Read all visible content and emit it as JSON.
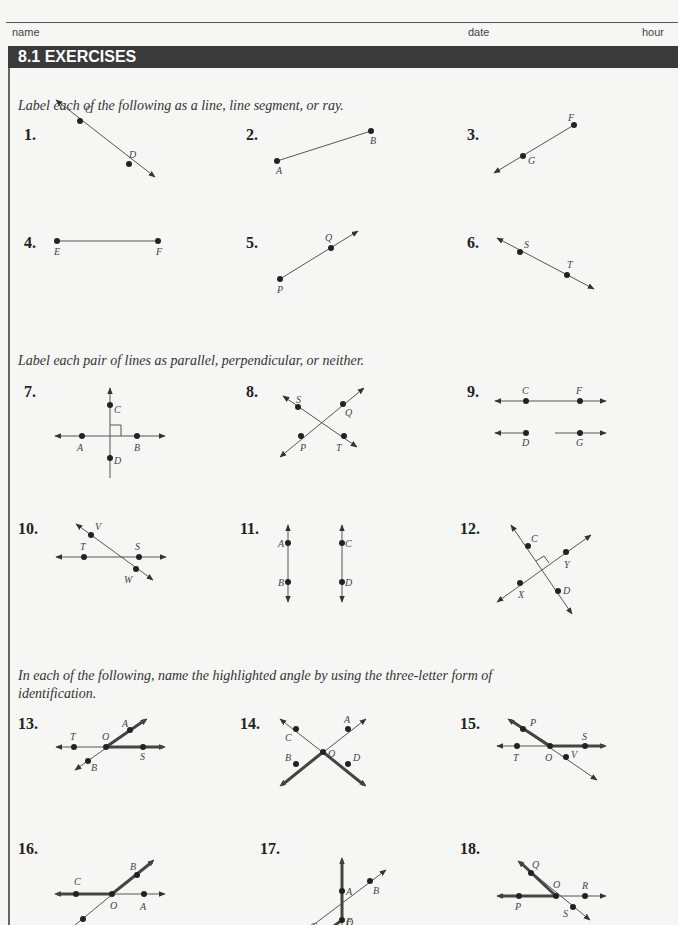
{
  "header": {
    "name_label": "name",
    "date_label": "date",
    "hour_label": "hour"
  },
  "section": {
    "title": "8.1 EXERCISES"
  },
  "instructions": [
    "Label each of the following as a line, line segment, or ray.",
    "Label each pair of lines as parallel, perpendicular, or neither.",
    "In each of the following, name the highlighted angle by using the three-letter form of",
    "identification."
  ],
  "exercises": [
    {
      "n": "1.",
      "points": [
        "C",
        "D"
      ],
      "type": "line"
    },
    {
      "n": "2.",
      "points": [
        "A",
        "B"
      ],
      "type": "segment"
    },
    {
      "n": "3.",
      "points": [
        "F",
        "G"
      ],
      "type": "ray"
    },
    {
      "n": "4.",
      "points": [
        "E",
        "F"
      ],
      "type": "segment"
    },
    {
      "n": "5.",
      "points": [
        "P",
        "Q"
      ],
      "type": "ray"
    },
    {
      "n": "6.",
      "points": [
        "S",
        "T"
      ],
      "type": "line"
    },
    {
      "n": "7.",
      "points": [
        "C",
        "A",
        "B",
        "D"
      ]
    },
    {
      "n": "8.",
      "points": [
        "S",
        "Q",
        "P",
        "T"
      ]
    },
    {
      "n": "9.",
      "points": [
        "C",
        "F",
        "D",
        "G"
      ]
    },
    {
      "n": "10.",
      "points": [
        "V",
        "T",
        "S",
        "W"
      ]
    },
    {
      "n": "11.",
      "points": [
        "A",
        "C",
        "B",
        "D"
      ]
    },
    {
      "n": "12.",
      "points": [
        "C",
        "Y",
        "X",
        "D"
      ]
    },
    {
      "n": "13.",
      "points": [
        "A",
        "T",
        "O",
        "S",
        "B"
      ]
    },
    {
      "n": "14.",
      "points": [
        "A",
        "C",
        "O",
        "B",
        "D"
      ]
    },
    {
      "n": "15.",
      "points": [
        "P",
        "S",
        "T",
        "O",
        "V"
      ]
    },
    {
      "n": "16.",
      "points": [
        "B",
        "C",
        "O",
        "A",
        "T"
      ]
    },
    {
      "n": "17.",
      "points": [
        "A",
        "B",
        "C",
        "O",
        "F"
      ]
    },
    {
      "n": "18.",
      "points": [
        "Q",
        "O",
        "R",
        "P",
        "S"
      ]
    }
  ]
}
